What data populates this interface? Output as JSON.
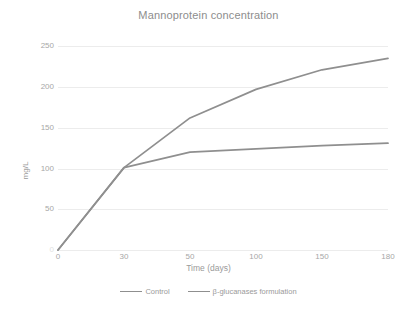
{
  "chart_data": {
    "type": "line",
    "title": "Mannoprotein concentration",
    "xlabel": "Time (days)",
    "ylabel": "mg/L",
    "categories": [
      "0",
      "30",
      "50",
      "100",
      "150",
      "180"
    ],
    "x_tick_labels": [
      "0",
      "30",
      "50",
      "100",
      "150",
      "180"
    ],
    "y_tick_labels": [
      "0",
      "50",
      "100",
      "150",
      "200",
      "250"
    ],
    "y_tick_values": [
      0,
      50,
      100,
      150,
      200,
      250
    ],
    "ylim": [
      0,
      260
    ],
    "grid": "horizontal",
    "legend_position": "bottom",
    "series": [
      {
        "name": "Control",
        "color": "#8f8f8f",
        "values": [
          0,
          101,
          120,
          124,
          128,
          131
        ]
      },
      {
        "name": "β-glucanases formulation",
        "color": "#8f8f8f",
        "values": [
          0,
          101,
          162,
          197,
          221,
          235
        ]
      }
    ],
    "colors": {
      "line": "#8f8f8f",
      "grid": "#ececec",
      "text": "#a7a7a7",
      "title": "#8d8d8d",
      "background": "#ffffff"
    }
  },
  "legend": {
    "items": [
      {
        "label": "Control"
      },
      {
        "label": "β-glucanases formulation"
      }
    ]
  }
}
